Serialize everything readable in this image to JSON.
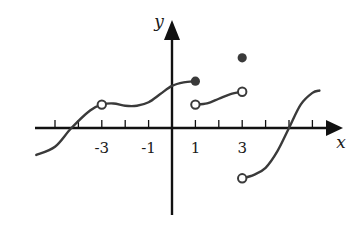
{
  "chart_data": {
    "type": "line",
    "title": "",
    "xlabel": "x",
    "ylabel": "y",
    "xlim": [
      -6,
      7
    ],
    "ylim": [
      -3.5,
      4.5
    ],
    "grid": false,
    "legend": null,
    "x_ticks": [
      -5,
      -4,
      -3,
      -2,
      -1,
      0,
      1,
      2,
      3,
      4,
      5,
      6
    ],
    "x_tick_labels": [
      {
        "value": -3,
        "label": "-3"
      },
      {
        "value": -1,
        "label": "-1"
      },
      {
        "value": 1,
        "label": "1"
      },
      {
        "value": 3,
        "label": "3"
      }
    ],
    "series": [
      {
        "name": "piece-1",
        "description": "curve from left edge through open circle at (-3,1) to filled dot at (1,2)",
        "x": [
          -5.8,
          -5,
          -4.3,
          -3.5,
          -3,
          -2.5,
          -2,
          -1.5,
          -1,
          -0.5,
          0,
          0.5,
          1
        ],
        "values": [
          -1.15,
          -0.8,
          0,
          0.75,
          1.0,
          1.05,
          0.95,
          0.95,
          1.1,
          1.45,
          1.8,
          1.95,
          2.0
        ]
      },
      {
        "name": "piece-2",
        "description": "curve from open circle (1,1) to open circle (3,1.5)",
        "x": [
          1,
          1.5,
          2,
          2.5,
          3
        ],
        "values": [
          1.0,
          1.05,
          1.25,
          1.45,
          1.55
        ]
      },
      {
        "name": "piece-3",
        "description": "curve from open circle (3,-2) rising through (5,0) to about (6.3,1.6)",
        "x": [
          3,
          3.5,
          4,
          4.5,
          5,
          5.5,
          6,
          6.3
        ],
        "values": [
          -2.15,
          -2.0,
          -1.7,
          -1.0,
          0,
          1.0,
          1.5,
          1.6
        ]
      }
    ],
    "points": [
      {
        "x": -3,
        "y": 1.0,
        "type": "open"
      },
      {
        "x": 1,
        "y": 2.0,
        "type": "filled"
      },
      {
        "x": 1,
        "y": 1.0,
        "type": "open"
      },
      {
        "x": 3,
        "y": 3.0,
        "type": "filled"
      },
      {
        "x": 3,
        "y": 1.55,
        "type": "open"
      },
      {
        "x": 3,
        "y": -2.15,
        "type": "open"
      }
    ],
    "colors": {
      "axis": "#111111",
      "curve": "#3a3a3a",
      "dot": "#3a3a3a"
    }
  }
}
